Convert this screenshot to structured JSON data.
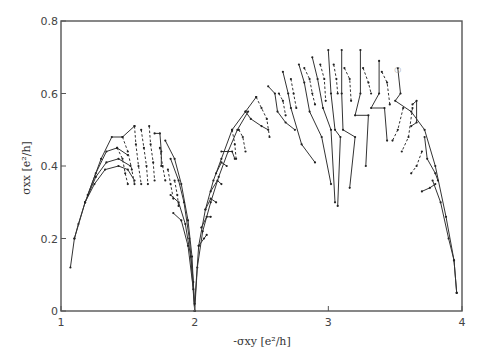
{
  "chart_data": {
    "type": "line",
    "title": "",
    "xlabel": "-σxy [e²/h]",
    "ylabel": "σxx [e²/h]",
    "xlim": [
      1,
      4
    ],
    "ylim": [
      0,
      0.8
    ],
    "x_ticks": [
      1,
      2,
      3,
      4
    ],
    "x_tick_labels": [
      "1",
      "2",
      "3",
      "4"
    ],
    "y_ticks": [
      0,
      0.2,
      0.4,
      0.6,
      0.8
    ],
    "y_tick_labels": [
      "0",
      "0.2",
      "0.4",
      "0.6",
      "0.8"
    ],
    "grid": false,
    "legend": null,
    "series": [
      {
        "name": "left-envelope-a",
        "style": "solid",
        "points": [
          [
            1.07,
            0.12
          ],
          [
            1.1,
            0.2
          ],
          [
            1.13,
            0.24
          ],
          [
            1.18,
            0.3
          ],
          [
            1.25,
            0.35
          ],
          [
            1.33,
            0.39
          ],
          [
            1.43,
            0.4
          ],
          [
            1.5,
            0.39
          ],
          [
            1.55,
            0.36
          ]
        ]
      },
      {
        "name": "left-envelope-b",
        "style": "solid",
        "points": [
          [
            1.1,
            0.2
          ],
          [
            1.18,
            0.3
          ],
          [
            1.26,
            0.37
          ],
          [
            1.34,
            0.41
          ],
          [
            1.43,
            0.42
          ],
          [
            1.52,
            0.4
          ]
        ]
      },
      {
        "name": "left-envelope-c",
        "style": "solid",
        "points": [
          [
            1.18,
            0.3
          ],
          [
            1.26,
            0.38
          ],
          [
            1.34,
            0.44
          ],
          [
            1.42,
            0.45
          ],
          [
            1.5,
            0.43
          ]
        ]
      },
      {
        "name": "left-envelope-d",
        "style": "solid",
        "points": [
          [
            1.2,
            0.32
          ],
          [
            1.3,
            0.42
          ],
          [
            1.38,
            0.48
          ],
          [
            1.46,
            0.48
          ],
          [
            1.55,
            0.51
          ]
        ]
      },
      {
        "name": "left-flow-1",
        "style": "dashed",
        "points": [
          [
            1.42,
            0.45
          ],
          [
            1.46,
            0.42
          ],
          [
            1.48,
            0.38
          ],
          [
            1.5,
            0.35
          ]
        ]
      },
      {
        "name": "left-flow-2",
        "style": "dashed",
        "points": [
          [
            1.46,
            0.48
          ],
          [
            1.5,
            0.44
          ],
          [
            1.53,
            0.39
          ],
          [
            1.55,
            0.35
          ]
        ]
      },
      {
        "name": "left-flow-3",
        "style": "dashed",
        "points": [
          [
            1.55,
            0.51
          ],
          [
            1.56,
            0.46
          ],
          [
            1.58,
            0.4
          ],
          [
            1.6,
            0.35
          ]
        ]
      },
      {
        "name": "left-flow-4",
        "style": "dashed",
        "points": [
          [
            1.6,
            0.5
          ],
          [
            1.62,
            0.45
          ],
          [
            1.64,
            0.4
          ],
          [
            1.65,
            0.35
          ]
        ]
      },
      {
        "name": "left-flow-5",
        "style": "dashed",
        "points": [
          [
            1.66,
            0.51
          ],
          [
            1.67,
            0.46
          ],
          [
            1.69,
            0.41
          ],
          [
            1.7,
            0.36
          ]
        ]
      },
      {
        "name": "left-flow-6",
        "style": "solid",
        "points": [
          [
            1.7,
            0.49
          ],
          [
            1.74,
            0.49
          ],
          [
            1.75,
            0.44
          ],
          [
            1.75,
            0.4
          ]
        ]
      },
      {
        "name": "left-flow-7",
        "style": "dashed",
        "points": [
          [
            1.74,
            0.45
          ],
          [
            1.76,
            0.4
          ],
          [
            1.78,
            0.36
          ]
        ]
      },
      {
        "name": "left-right-arc-a",
        "style": "solid",
        "points": [
          [
            1.78,
            0.47
          ],
          [
            1.85,
            0.42
          ],
          [
            1.9,
            0.35
          ],
          [
            1.95,
            0.25
          ],
          [
            1.98,
            0.15
          ],
          [
            2.0,
            0.0
          ]
        ]
      },
      {
        "name": "left-right-arc-b",
        "style": "solid",
        "points": [
          [
            1.82,
            0.42
          ],
          [
            1.88,
            0.36
          ],
          [
            1.92,
            0.3
          ],
          [
            1.96,
            0.2
          ],
          [
            1.99,
            0.08
          ],
          [
            2.0,
            0.0
          ]
        ]
      },
      {
        "name": "left-right-arc-c",
        "style": "solid",
        "points": [
          [
            1.82,
            0.32
          ],
          [
            1.88,
            0.3
          ],
          [
            1.93,
            0.24
          ],
          [
            1.97,
            0.15
          ],
          [
            2.0,
            0.0
          ]
        ]
      },
      {
        "name": "left-right-arc-d",
        "style": "solid",
        "points": [
          [
            1.84,
            0.27
          ],
          [
            1.9,
            0.25
          ],
          [
            1.95,
            0.18
          ],
          [
            1.99,
            0.06
          ]
        ]
      },
      {
        "name": "left-flow-8",
        "style": "dashed",
        "points": [
          [
            1.8,
            0.39
          ],
          [
            1.82,
            0.35
          ],
          [
            1.84,
            0.31
          ]
        ]
      },
      {
        "name": "left-flow-9",
        "style": "dashed",
        "points": [
          [
            1.85,
            0.36
          ],
          [
            1.87,
            0.32
          ],
          [
            1.88,
            0.29
          ]
        ]
      },
      {
        "name": "right-envelope-a",
        "style": "solid",
        "points": [
          [
            2.0,
            0.0
          ],
          [
            2.02,
            0.12
          ],
          [
            2.06,
            0.22
          ],
          [
            2.12,
            0.3
          ],
          [
            2.18,
            0.37
          ],
          [
            2.25,
            0.44
          ],
          [
            2.32,
            0.5
          ],
          [
            2.4,
            0.55
          ]
        ]
      },
      {
        "name": "right-envelope-b",
        "style": "solid",
        "points": [
          [
            2.0,
            0.02
          ],
          [
            2.03,
            0.18
          ],
          [
            2.08,
            0.28
          ],
          [
            2.14,
            0.36
          ],
          [
            2.2,
            0.42
          ],
          [
            2.28,
            0.5
          ],
          [
            2.38,
            0.55
          ],
          [
            2.46,
            0.59
          ]
        ]
      },
      {
        "name": "right-flow-low-1",
        "style": "solid",
        "points": [
          [
            2.03,
            0.18
          ],
          [
            2.07,
            0.2
          ],
          [
            2.09,
            0.21
          ]
        ]
      },
      {
        "name": "right-flow-low-2",
        "style": "solid",
        "points": [
          [
            2.05,
            0.23
          ],
          [
            2.09,
            0.26
          ],
          [
            2.12,
            0.26
          ]
        ]
      },
      {
        "name": "right-flow-low-3",
        "style": "solid",
        "points": [
          [
            2.08,
            0.28
          ],
          [
            2.12,
            0.31
          ],
          [
            2.16,
            0.3
          ]
        ]
      },
      {
        "name": "right-flow-low-4",
        "style": "solid",
        "points": [
          [
            2.12,
            0.33
          ],
          [
            2.17,
            0.36
          ],
          [
            2.2,
            0.35
          ]
        ]
      },
      {
        "name": "right-flow-low-5",
        "style": "solid",
        "points": [
          [
            2.16,
            0.38
          ],
          [
            2.2,
            0.41
          ],
          [
            2.24,
            0.4
          ]
        ]
      },
      {
        "name": "right-flow-6",
        "style": "solid",
        "points": [
          [
            2.2,
            0.44
          ],
          [
            2.28,
            0.44
          ],
          [
            2.3,
            0.42
          ]
        ]
      },
      {
        "name": "right-flow-7",
        "style": "dashed",
        "points": [
          [
            2.28,
            0.5
          ],
          [
            2.3,
            0.46
          ],
          [
            2.31,
            0.42
          ]
        ]
      },
      {
        "name": "right-flow-8",
        "style": "dashed",
        "points": [
          [
            2.33,
            0.5
          ],
          [
            2.36,
            0.48
          ],
          [
            2.38,
            0.44
          ]
        ]
      },
      {
        "name": "right-flow-9",
        "style": "solid",
        "points": [
          [
            2.38,
            0.55
          ],
          [
            2.42,
            0.53
          ],
          [
            2.5,
            0.51
          ],
          [
            2.55,
            0.5
          ]
        ]
      },
      {
        "name": "right-flow-10",
        "style": "dashed",
        "points": [
          [
            2.46,
            0.59
          ],
          [
            2.5,
            0.56
          ],
          [
            2.54,
            0.53
          ],
          [
            2.56,
            0.48
          ]
        ]
      },
      {
        "name": "right-flow-11",
        "style": "solid",
        "points": [
          [
            2.55,
            0.62
          ],
          [
            2.6,
            0.6
          ],
          [
            2.62,
            0.55
          ],
          [
            2.68,
            0.52
          ],
          [
            2.75,
            0.5
          ]
        ]
      },
      {
        "name": "right-flow-12",
        "style": "dashed",
        "points": [
          [
            2.63,
            0.6
          ],
          [
            2.66,
            0.58
          ],
          [
            2.68,
            0.54
          ]
        ]
      },
      {
        "name": "right-flow-13",
        "style": "solid",
        "points": [
          [
            2.66,
            0.66
          ],
          [
            2.7,
            0.6
          ],
          [
            2.72,
            0.56
          ],
          [
            2.8,
            0.46
          ],
          [
            2.9,
            0.41
          ]
        ]
      },
      {
        "name": "right-flow-14",
        "style": "dashed",
        "points": [
          [
            2.72,
            0.64
          ],
          [
            2.74,
            0.6
          ],
          [
            2.76,
            0.56
          ]
        ]
      },
      {
        "name": "right-flow-15",
        "style": "solid",
        "points": [
          [
            2.78,
            0.68
          ],
          [
            2.82,
            0.63
          ],
          [
            2.86,
            0.55
          ],
          [
            2.95,
            0.48
          ],
          [
            3.02,
            0.35
          ]
        ]
      },
      {
        "name": "right-flow-16",
        "style": "dashed",
        "points": [
          [
            2.82,
            0.67
          ],
          [
            2.86,
            0.64
          ],
          [
            2.88,
            0.6
          ],
          [
            2.9,
            0.57
          ]
        ]
      },
      {
        "name": "right-flow-17",
        "style": "solid",
        "points": [
          [
            2.88,
            0.7
          ],
          [
            2.92,
            0.64
          ],
          [
            2.96,
            0.56
          ],
          [
            3.02,
            0.5
          ],
          [
            3.05,
            0.3
          ]
        ]
      },
      {
        "name": "right-flow-18",
        "style": "dashed",
        "points": [
          [
            2.94,
            0.68
          ],
          [
            2.97,
            0.64
          ],
          [
            2.98,
            0.58
          ]
        ]
      },
      {
        "name": "right-flow-19",
        "style": "solid",
        "points": [
          [
            3.0,
            0.72
          ],
          [
            3.02,
            0.6
          ],
          [
            3.05,
            0.5
          ],
          [
            3.09,
            0.48
          ],
          [
            3.07,
            0.29
          ]
        ]
      },
      {
        "name": "right-flow-20",
        "style": "dashed",
        "points": [
          [
            3.04,
            0.68
          ],
          [
            3.06,
            0.64
          ],
          [
            3.07,
            0.6
          ]
        ]
      },
      {
        "name": "right-flow-21",
        "style": "solid",
        "points": [
          [
            3.1,
            0.72
          ],
          [
            3.1,
            0.6
          ],
          [
            3.11,
            0.5
          ],
          [
            3.2,
            0.48
          ],
          [
            3.16,
            0.34
          ]
        ]
      },
      {
        "name": "right-flow-22",
        "style": "dashed",
        "points": [
          [
            3.12,
            0.67
          ],
          [
            3.16,
            0.64
          ],
          [
            3.17,
            0.58
          ]
        ]
      },
      {
        "name": "right-flow-23",
        "style": "solid",
        "points": [
          [
            3.24,
            0.72
          ],
          [
            3.24,
            0.6
          ],
          [
            3.2,
            0.54
          ],
          [
            3.3,
            0.54
          ],
          [
            3.28,
            0.4
          ]
        ]
      },
      {
        "name": "right-flow-24",
        "style": "dashed",
        "points": [
          [
            3.26,
            0.67
          ],
          [
            3.3,
            0.63
          ],
          [
            3.32,
            0.6
          ]
        ]
      },
      {
        "name": "right-flow-25",
        "style": "solid",
        "points": [
          [
            3.38,
            0.69
          ],
          [
            3.38,
            0.6
          ],
          [
            3.32,
            0.56
          ],
          [
            3.42,
            0.56
          ],
          [
            3.44,
            0.47
          ]
        ]
      },
      {
        "name": "right-flow-26",
        "style": "dashed",
        "points": [
          [
            3.4,
            0.66
          ],
          [
            3.44,
            0.63
          ],
          [
            3.46,
            0.57
          ]
        ]
      },
      {
        "name": "right-flow-27",
        "style": "solid",
        "points": [
          [
            3.52,
            0.67
          ],
          [
            3.54,
            0.6
          ],
          [
            3.5,
            0.58
          ],
          [
            3.62,
            0.55
          ],
          [
            3.72,
            0.5
          ],
          [
            3.8,
            0.4
          ],
          [
            3.88,
            0.26
          ],
          [
            3.94,
            0.14
          ],
          [
            3.96,
            0.05
          ]
        ]
      },
      {
        "name": "right-flow-28",
        "style": "dashed",
        "points": [
          [
            3.56,
            0.56
          ],
          [
            3.52,
            0.5
          ],
          [
            3.48,
            0.47
          ]
        ]
      },
      {
        "name": "right-flow-29",
        "style": "solid",
        "points": [
          [
            3.63,
            0.57
          ],
          [
            3.66,
            0.58
          ],
          [
            3.66,
            0.52
          ],
          [
            3.62,
            0.51
          ]
        ]
      },
      {
        "name": "right-flow-30",
        "style": "dashed",
        "points": [
          [
            3.63,
            0.56
          ],
          [
            3.6,
            0.48
          ],
          [
            3.55,
            0.44
          ]
        ]
      },
      {
        "name": "right-flow-31",
        "style": "solid",
        "points": [
          [
            3.72,
            0.48
          ],
          [
            3.74,
            0.42
          ],
          [
            3.8,
            0.38
          ],
          [
            3.82,
            0.36
          ]
        ]
      },
      {
        "name": "right-flow-32",
        "style": "dashed",
        "points": [
          [
            3.7,
            0.44
          ],
          [
            3.66,
            0.4
          ],
          [
            3.62,
            0.38
          ]
        ]
      },
      {
        "name": "right-flow-33",
        "style": "solid",
        "points": [
          [
            3.8,
            0.35
          ],
          [
            3.76,
            0.34
          ],
          [
            3.7,
            0.33
          ]
        ]
      },
      {
        "name": "right-envelope-tail",
        "style": "solid",
        "points": [
          [
            3.78,
            0.36
          ],
          [
            3.84,
            0.3
          ],
          [
            3.9,
            0.2
          ],
          [
            3.94,
            0.14
          ],
          [
            3.96,
            0.05
          ]
        ]
      }
    ],
    "annotations": [
      {
        "text": "○",
        "x": 3.52,
        "y": 0.66
      }
    ]
  }
}
